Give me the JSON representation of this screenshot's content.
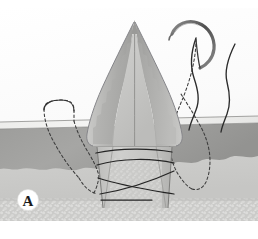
{
  "figure": {
    "domain_type": "medical-illustration",
    "panel_label": "A",
    "title": "",
    "caption": "",
    "background_color": "#ffffff"
  },
  "colors": {
    "panel_background": "#fbfbfb",
    "epidermis": "#f2f2f0",
    "dermis": "#9a9a98",
    "subcutaneous": "#cfcfcd",
    "fat_texture": "#c8c8c6",
    "cone_light": "#d8d8d6",
    "cone_mid": "#b4b4b2",
    "cone_dark": "#9c9c9a",
    "cone_edge": "#8a8a88",
    "suture_thread": "#2a2a2a",
    "needle": "#6f6f6f",
    "dashed_suture": "#3a3a3a",
    "label_circle": "#ffffff",
    "label_text": "#1b1b1b"
  },
  "anatomy": {
    "layers": [
      {
        "id": "epidermis",
        "name": "Epidermis",
        "visible": true
      },
      {
        "id": "dermis",
        "name": "Dermis",
        "visible": true
      },
      {
        "id": "subcutaneous",
        "name": "Subcutaneous fat",
        "visible": true
      },
      {
        "id": "deep-fat",
        "name": "Deep fatty tissue",
        "visible": true
      }
    ]
  },
  "elements": {
    "cone": {
      "name": "Tented conical skin flap",
      "apex_label": "",
      "visible": true
    },
    "needle": {
      "name": "Curved surgical needle",
      "visible": true
    },
    "thread_left": {
      "name": "Suture thread (left limb)",
      "visible": true
    },
    "thread_right": {
      "name": "Suture thread (right limb)",
      "visible": true
    },
    "buried_suture": {
      "name": "Buried suture path (dashed)",
      "visible": true
    },
    "crossing_sutures": {
      "name": "Crossing suture strands",
      "count": 5,
      "visible": true
    }
  }
}
